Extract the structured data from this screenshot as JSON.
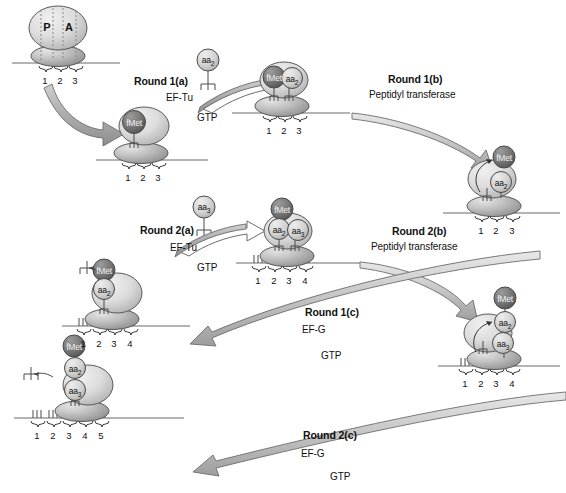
{
  "figure": {
    "colors": {
      "fmet_fill": "#6e6e6e",
      "aa_fill": "#d9d9d9",
      "subunit_light": "#d2d2d2",
      "subunit_dark": "#9a9a9a",
      "arrow_fill": "#b3b3b3",
      "outline": "#4a4a4a",
      "mrna_line": "#6a6a6a",
      "text": "#111111"
    }
  },
  "steps": [
    {
      "id": "round1a",
      "title": "Round 1(a)",
      "factor": "EF-Tu",
      "energy": "GTP"
    },
    {
      "id": "round1b",
      "title": "Round 1(b)",
      "factor": "Peptidyl transferase",
      "energy": ""
    },
    {
      "id": "round1c",
      "title": "Round 1(c)",
      "factor": "EF-G",
      "energy": "GTP"
    },
    {
      "id": "round2a",
      "title": "Round 2(a)",
      "factor": "EF-Tu",
      "energy": "GTP"
    },
    {
      "id": "round2b",
      "title": "Round 2(b)",
      "factor": "Peptidyl transferase",
      "energy": ""
    },
    {
      "id": "round2c",
      "title": "Round 2(c)",
      "factor": "EF-G",
      "energy": "GTP"
    }
  ],
  "sites": {
    "p_site": "P",
    "a_site": "A"
  },
  "residues": {
    "fmet": "fMet",
    "aa2": "aa",
    "aa2_sub": "2",
    "aa3": "aa",
    "aa3_sub": "3"
  },
  "complexes": [
    {
      "id": "initiation",
      "name": "initiation-complex",
      "codons": [
        "1",
        "2",
        "3"
      ],
      "peptide": [],
      "site_labels": [
        "P",
        "A"
      ]
    },
    {
      "id": "fmet-loaded",
      "name": "fmet-initiation-complex",
      "codons": [
        "1",
        "2",
        "3"
      ],
      "peptide": [
        "fMet"
      ],
      "site_labels": []
    },
    {
      "id": "fmet-aa2-bound",
      "name": "fmet-aa2-complex",
      "codons": [
        "1",
        "2",
        "3"
      ],
      "peptide": [
        "fMet",
        "aa2"
      ],
      "site_labels": []
    },
    {
      "id": "dipeptide",
      "name": "dipeptidyl-trna-complex",
      "codons": [
        "1",
        "2",
        "3"
      ],
      "peptide": [
        "fMet",
        "aa2"
      ],
      "site_labels": []
    },
    {
      "id": "translocated-1",
      "name": "translocated-complex-round1",
      "codons": [
        "1",
        "2",
        "3",
        "4"
      ],
      "peptide": [
        "fMet",
        "aa2"
      ],
      "site_labels": []
    },
    {
      "id": "fmet-aa2-aa3-bound",
      "name": "fmet-aa2-aa3-complex",
      "codons": [
        "1",
        "2",
        "3",
        "4"
      ],
      "peptide": [
        "fMet",
        "aa2",
        "aa3"
      ],
      "site_labels": []
    },
    {
      "id": "tripeptide",
      "name": "tripeptidyl-trna-complex",
      "codons": [
        "1",
        "2",
        "3",
        "4"
      ],
      "peptide": [
        "fMet",
        "aa2",
        "aa3"
      ],
      "site_labels": []
    },
    {
      "id": "translocated-2",
      "name": "translocated-complex-round2",
      "codons": [
        "1",
        "2",
        "3",
        "4",
        "5"
      ],
      "peptide": [
        "fMet",
        "aa2",
        "aa3"
      ],
      "site_labels": []
    }
  ],
  "incoming_aminoacyl_trna": [
    {
      "id": "aatrna2",
      "label": "aa",
      "sub": "2"
    },
    {
      "id": "aatrna3",
      "label": "aa",
      "sub": "3"
    }
  ],
  "released_trna": [
    {
      "id": "released-trna-1"
    },
    {
      "id": "released-trna-2"
    }
  ]
}
